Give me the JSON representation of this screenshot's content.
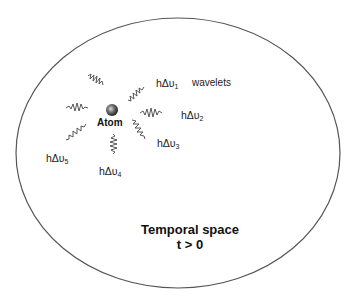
{
  "diagram": {
    "container": {
      "label": "Temporal space",
      "condition": "t > 0",
      "shape": "ellipse",
      "stroke_color": "#555555"
    },
    "atom": {
      "label": "Atom",
      "color": "#777777"
    },
    "wavelets_label": "wavelets",
    "emissions": [
      {
        "prefix": "hΔυ",
        "sub": "1"
      },
      {
        "prefix": "hΔυ",
        "sub": "2"
      },
      {
        "prefix": "hΔυ",
        "sub": "3"
      },
      {
        "prefix": "hΔυ",
        "sub": "4"
      },
      {
        "prefix": "hΔυ",
        "sub": "5"
      }
    ]
  }
}
